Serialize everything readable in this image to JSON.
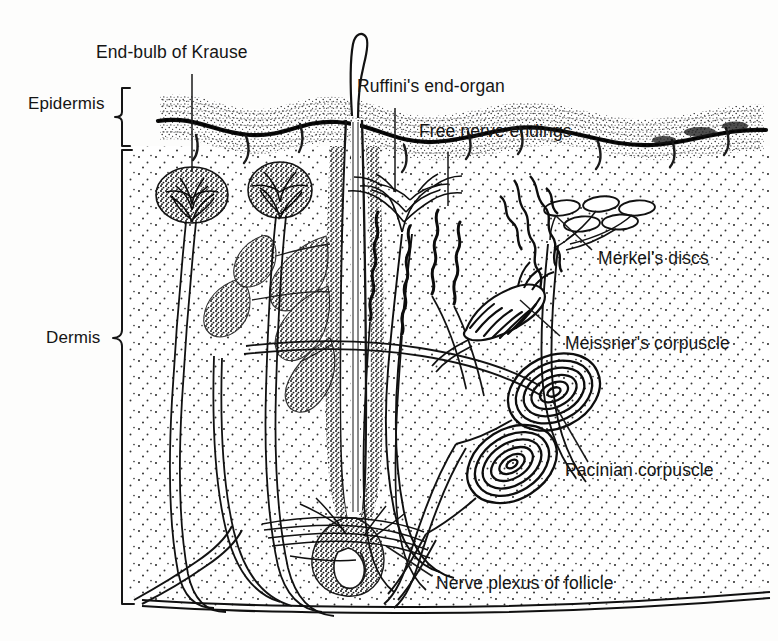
{
  "figure": {
    "type": "anatomical-cross-section-diagram",
    "background_color": "#fdfdfc",
    "ink_color": "#151515",
    "width": 778,
    "height": 641
  },
  "layer_brackets": [
    {
      "id": "epidermis",
      "label": "Epidermis",
      "label_x": 28,
      "label_y": 103,
      "bracket_x": 122,
      "bracket_top": 88,
      "bracket_bottom": 147
    },
    {
      "id": "dermis",
      "label": "Dermis",
      "label_x": 46,
      "label_y": 337,
      "bracket_x": 122,
      "bracket_top": 150,
      "bracket_bottom": 604
    }
  ],
  "callouts": [
    {
      "id": "end-bulb-of-krause",
      "label": "End-bulb of Krause",
      "label_x": 96,
      "label_y": 53,
      "leader": {
        "x1": 192,
        "y1": 74,
        "x2": 192,
        "y2": 172
      }
    },
    {
      "id": "ruffinis-end-organ",
      "label": "Ruffini's end-organ",
      "label_x": 357,
      "label_y": 87,
      "leader": {
        "x1": 395,
        "y1": 108,
        "x2": 395,
        "y2": 192
      }
    },
    {
      "id": "free-nerve-endings",
      "label": "Free nerve endings",
      "label_x": 419,
      "label_y": 132,
      "leader": {
        "x1": 448,
        "y1": 152,
        "x2": 448,
        "y2": 206
      }
    },
    {
      "id": "merkels-discs",
      "label": "Merkel's discs",
      "label_x": 598,
      "label_y": 258,
      "leader": {
        "x1": 592,
        "y1": 250,
        "x2": 558,
        "y2": 218
      }
    },
    {
      "id": "meissners-corpuscle",
      "label": "Meissner's corpuscle",
      "label_x": 565,
      "label_y": 343,
      "leader": {
        "x1": 560,
        "y1": 336,
        "x2": 521,
        "y2": 302
      }
    },
    {
      "id": "pacinian-corpuscle",
      "label": "Pacinian corpuscle",
      "label_x": 565,
      "label_y": 470,
      "leader": {
        "x1": 588,
        "y1": 462,
        "x2": 552,
        "y2": 400
      }
    },
    {
      "id": "nerve-plexus-of-follicle",
      "label": "Nerve plexus of follicle",
      "label_x": 436,
      "label_y": 583,
      "leader": {
        "x1": 432,
        "y1": 576,
        "x2": 388,
        "y2": 548
      }
    }
  ],
  "structures": [
    {
      "id": "hair-shaft",
      "name": "hair shaft"
    },
    {
      "id": "hair-follicle",
      "name": "hair follicle"
    },
    {
      "id": "hair-bulb",
      "name": "hair bulb"
    },
    {
      "id": "sebaceous-gland",
      "name": "sebaceous gland lobes"
    },
    {
      "id": "krause-bulb-left",
      "name": "end-bulb of Krause (left)"
    },
    {
      "id": "krause-bulb-right",
      "name": "end-bulb of Krause (right)"
    },
    {
      "id": "merkel-disc-cluster",
      "name": "Merkel's disc cluster",
      "count": 5
    },
    {
      "id": "meissner-corpuscle",
      "name": "Meissner's corpuscle"
    },
    {
      "id": "pacinian-corpuscle-upper",
      "name": "Pacinian corpuscle (upper)"
    },
    {
      "id": "pacinian-corpuscle-lower",
      "name": "Pacinian corpuscle (lower)"
    },
    {
      "id": "ruffini-plexus",
      "name": "Ruffini's end-organ branching plexus"
    },
    {
      "id": "free-nerve-ending-fibers",
      "name": "free nerve ending fibers",
      "count": 4
    },
    {
      "id": "nerve-trunks",
      "name": "nerve trunks ascending through dermis"
    },
    {
      "id": "subcutaneous-boundary",
      "name": "lower boundary of dermis"
    }
  ]
}
